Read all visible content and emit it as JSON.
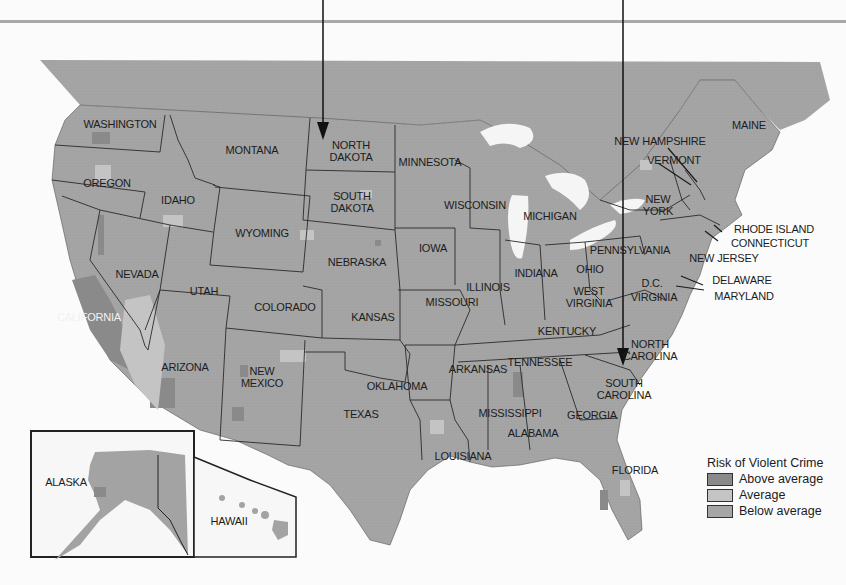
{
  "map": {
    "title_arrows": [
      "north-dakota-pointer",
      "south-carolina-pointer"
    ],
    "states": [
      {
        "name": "WASHINGTON",
        "x": 120,
        "y": 124
      },
      {
        "name": "OREGON",
        "x": 107,
        "y": 183
      },
      {
        "name": "IDAHO",
        "x": 178,
        "y": 200
      },
      {
        "name": "MONTANA",
        "x": 252,
        "y": 150
      },
      {
        "name": "WYOMING",
        "x": 262,
        "y": 233
      },
      {
        "name": "NEVADA",
        "x": 137,
        "y": 274
      },
      {
        "name": "UTAH",
        "x": 204,
        "y": 291
      },
      {
        "name": "COLORADO",
        "x": 285,
        "y": 307
      },
      {
        "name": "CALIFORNIA",
        "x": 89,
        "y": 317,
        "white": true
      },
      {
        "name": "ARIZONA",
        "x": 185,
        "y": 367
      },
      {
        "name": "NEW\nMEXICO",
        "x": 262,
        "y": 377
      },
      {
        "name": "NORTH\nDAKOTA",
        "x": 351,
        "y": 151
      },
      {
        "name": "SOUTH\nDAKOTA",
        "x": 352,
        "y": 202
      },
      {
        "name": "NEBRASKA",
        "x": 357,
        "y": 262
      },
      {
        "name": "KANSAS",
        "x": 373,
        "y": 317
      },
      {
        "name": "OKLAHOMA",
        "x": 397,
        "y": 386
      },
      {
        "name": "TEXAS",
        "x": 361,
        "y": 414
      },
      {
        "name": "MINNESOTA",
        "x": 430,
        "y": 162
      },
      {
        "name": "IOWA",
        "x": 433,
        "y": 248
      },
      {
        "name": "MISSOURI",
        "x": 452,
        "y": 302
      },
      {
        "name": "ARKANSAS",
        "x": 478,
        "y": 369
      },
      {
        "name": "LOUISIANA",
        "x": 463,
        "y": 456
      },
      {
        "name": "WISCONSIN",
        "x": 475,
        "y": 205
      },
      {
        "name": "ILLINOIS",
        "x": 488,
        "y": 287
      },
      {
        "name": "MICHIGAN",
        "x": 550,
        "y": 216
      },
      {
        "name": "INDIANA",
        "x": 536,
        "y": 273
      },
      {
        "name": "OHIO",
        "x": 590,
        "y": 269
      },
      {
        "name": "KENTUCKY",
        "x": 567,
        "y": 331
      },
      {
        "name": "TENNESSEE",
        "x": 540,
        "y": 362
      },
      {
        "name": "MISSISSIPPI",
        "x": 510,
        "y": 413
      },
      {
        "name": "ALABAMA",
        "x": 533,
        "y": 433
      },
      {
        "name": "GEORGIA",
        "x": 592,
        "y": 415
      },
      {
        "name": "FLORIDA",
        "x": 635,
        "y": 470
      },
      {
        "name": "SOUTH\nCAROLINA",
        "x": 624,
        "y": 389
      },
      {
        "name": "NORTH\nCAROLINA",
        "x": 650,
        "y": 350
      },
      {
        "name": "WEST\nVIRGINIA",
        "x": 589,
        "y": 297
      },
      {
        "name": "VIRGINIA",
        "x": 654,
        "y": 297
      },
      {
        "name": "D.C.",
        "x": 652,
        "y": 283
      },
      {
        "name": "PENNSYLVANIA",
        "x": 630,
        "y": 250
      },
      {
        "name": "NEW\nYORK",
        "x": 658,
        "y": 205
      },
      {
        "name": "MAINE",
        "x": 749,
        "y": 125
      },
      {
        "name": "ALASKA",
        "x": 66,
        "y": 482
      },
      {
        "name": "HAWAII",
        "x": 229,
        "y": 521
      }
    ],
    "callouts": [
      {
        "name": "NEW HAMPSHIRE",
        "x": 660,
        "y": 141
      },
      {
        "name": "VERMONT",
        "x": 674,
        "y": 160
      },
      {
        "name": "RHODE ISLAND",
        "x": 774,
        "y": 229
      },
      {
        "name": "CONNECTICUT",
        "x": 770,
        "y": 243
      },
      {
        "name": "NEW JERSEY",
        "x": 724,
        "y": 258
      },
      {
        "name": "DELAWARE",
        "x": 742,
        "y": 280
      },
      {
        "name": "MARYLAND",
        "x": 744,
        "y": 296
      }
    ]
  },
  "legend": {
    "title": "Risk of Violent Crime",
    "items": [
      {
        "label": "Above average",
        "color": "#8a8a8a"
      },
      {
        "label": "Average",
        "color": "#c4c4c4"
      },
      {
        "label": "Below average",
        "color": "#a6a6a6"
      }
    ]
  },
  "colors": {
    "land": "#a3a3a3",
    "above": "#8a8a8a",
    "average": "#c4c4c4",
    "water": "#f5f5f5",
    "canada": "#a8a8a8"
  }
}
